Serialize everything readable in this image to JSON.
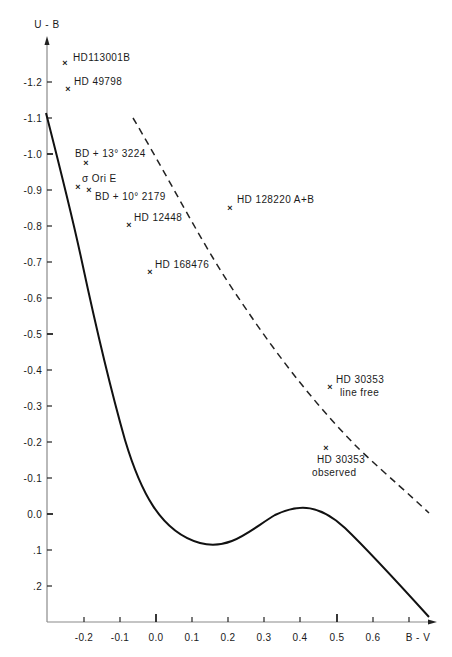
{
  "chart_data": {
    "type": "scatter",
    "title": "",
    "xlabel": "B - V",
    "ylabel": "U - B",
    "xlim": [
      -0.3,
      0.78
    ],
    "ylim": [
      0.3,
      -1.33
    ],
    "y_inverted": true,
    "grid": false,
    "legend": null,
    "x_ticks": [
      "-0.2",
      "-0.1",
      "0.0",
      "0.1",
      "0.2",
      "0.3",
      "0.4",
      "0.5",
      "0.6",
      "0.7"
    ],
    "x_tick_labels": [
      "-0.2",
      "-0.1",
      "0.0",
      "0.1",
      "0.2",
      "0.3",
      "0.4",
      "0.5",
      "0.6",
      "B - V"
    ],
    "y_ticks": [
      -1.2,
      -1.1,
      -1.0,
      -0.9,
      -0.8,
      -0.7,
      -0.6,
      -0.5,
      -0.4,
      -0.3,
      -0.2,
      -0.1,
      0.0,
      0.1,
      0.2
    ],
    "y_tick_labels": [
      "-1.2",
      "-1.1",
      "-1.0",
      "-0.9",
      "-0.8",
      "-0.7",
      "-0.6",
      "-0.5",
      "-0.4",
      "-0.3",
      "-0.2",
      "-0.1",
      "0.0",
      ".1",
      ".2"
    ],
    "points": [
      {
        "label": "HD113001B",
        "x": -0.25,
        "y": -1.25
      },
      {
        "label": "HD 49798",
        "x": -0.24,
        "y": -1.18
      },
      {
        "label": "BD + 13° 3224",
        "x": -0.19,
        "y": -0.98
      },
      {
        "label": "σ Ori E",
        "x": -0.22,
        "y": -0.91
      },
      {
        "label": "BD + 10° 2179",
        "x": -0.19,
        "y": -0.9
      },
      {
        "label": "HD 12448",
        "x": -0.075,
        "y": -0.8
      },
      {
        "label": "HD 168476",
        "x": -0.02,
        "y": -0.67
      },
      {
        "label": "HD 128220  A+B",
        "x": 0.205,
        "y": -0.85
      },
      {
        "label": "HD 30353 line free",
        "x": 0.485,
        "y": -0.35
      },
      {
        "label": "HD 30353 observed",
        "x": 0.47,
        "y": -0.18
      }
    ],
    "series": [
      {
        "name": "main sequence (solid curve)",
        "style": "solid",
        "x": [
          -0.3,
          -0.25,
          -0.2,
          -0.15,
          -0.1,
          -0.05,
          0.0,
          0.05,
          0.1,
          0.15,
          0.2,
          0.25,
          0.3,
          0.35,
          0.4,
          0.45,
          0.5,
          0.55,
          0.6,
          0.65,
          0.7,
          0.76
        ],
        "y": [
          -1.1,
          -0.9,
          -0.7,
          -0.5,
          -0.32,
          -0.16,
          -0.02,
          0.06,
          0.08,
          0.09,
          0.07,
          0.02,
          -0.02,
          -0.03,
          -0.02,
          0.02,
          0.08,
          0.14,
          0.19,
          0.23,
          0.26,
          0.28
        ]
      },
      {
        "name": "blackbody line (dashed)",
        "style": "dashed",
        "x": [
          -0.065,
          0.0,
          0.1,
          0.2,
          0.3,
          0.4,
          0.5,
          0.6,
          0.76
        ],
        "y": [
          -1.1,
          -1.0,
          -0.86,
          -0.71,
          -0.57,
          -0.43,
          -0.3,
          -0.17,
          0.0
        ]
      }
    ]
  },
  "labels": {
    "y_axis_title": "U - B",
    "x_axis_title": "B - V",
    "y_ticks": [
      {
        "text": "-1.2",
        "y": 82
      },
      {
        "text": "-1.1",
        "y": 118
      },
      {
        "text": "-1.0",
        "y": 154
      },
      {
        "text": "-0.9",
        "y": 190
      },
      {
        "text": "-0.8",
        "y": 226
      },
      {
        "text": "-0.7",
        "y": 262
      },
      {
        "text": "-0.6",
        "y": 298
      },
      {
        "text": "-0.5",
        "y": 334
      },
      {
        "text": "-0.4",
        "y": 370
      },
      {
        "text": "-0.3",
        "y": 406
      },
      {
        "text": "-0.2",
        "y": 442
      },
      {
        "text": "-0.1",
        "y": 478
      },
      {
        "text": "0.0",
        "y": 514
      },
      {
        "text": ".1",
        "y": 550
      },
      {
        "text": ".2",
        "y": 586
      }
    ],
    "x_ticks": [
      {
        "text": "-0.2",
        "x": 84
      },
      {
        "text": "-0.1",
        "x": 120
      },
      {
        "text": "0.0",
        "x": 156
      },
      {
        "text": "0.1",
        "x": 192
      },
      {
        "text": "0.2",
        "x": 228
      },
      {
        "text": "0.3",
        "x": 264
      },
      {
        "text": "0.4",
        "x": 300
      },
      {
        "text": "0.5",
        "x": 337
      },
      {
        "text": "0.6",
        "x": 373
      },
      {
        "text": "",
        "x": 409
      }
    ],
    "stars": {
      "hd113001b": "HD113001B",
      "hd49798": "HD 49798",
      "bd13": "BD + 13° 3224",
      "sigma_ori_e": "σ Ori E",
      "bd10": "BD + 10° 2179",
      "hd12448": "HD 12448",
      "hd168476": "HD 168476",
      "hd128220": "HD 128220   A+B",
      "hd30353_lf_1": "HD 30353",
      "hd30353_lf_2": "line free",
      "hd30353_obs_1": "HD 30353",
      "hd30353_obs_2": "observed"
    }
  }
}
